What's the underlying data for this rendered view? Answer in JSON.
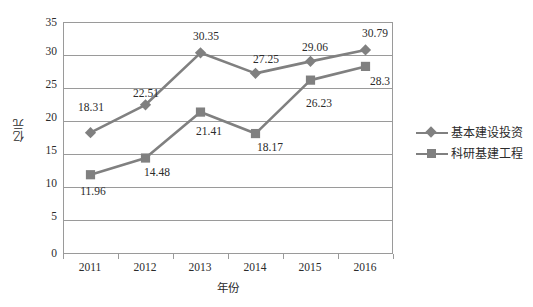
{
  "chart_data": {
    "type": "line",
    "title": "",
    "xlabel": "年份",
    "ylabel": "亿元",
    "categories": [
      "2011",
      "2012",
      "2013",
      "2014",
      "2015",
      "2016"
    ],
    "ylim": [
      0,
      35
    ],
    "yticks": [
      "0",
      "5",
      "10",
      "15",
      "20",
      "25",
      "30",
      "35"
    ],
    "grid": true,
    "legend_position": "right",
    "series": [
      {
        "name": "基本建设投资",
        "marker": "diamond",
        "color": "#808080",
        "values": [
          18.31,
          22.51,
          30.35,
          27.25,
          29.06,
          30.79
        ],
        "labels": [
          "18.31",
          "22.51",
          "30.35",
          "27.25",
          "29.06",
          "30.79"
        ]
      },
      {
        "name": "科研基建工程",
        "marker": "square",
        "color": "#808080",
        "values": [
          11.96,
          14.48,
          21.41,
          18.17,
          26.23,
          28.3
        ],
        "labels": [
          "11.96",
          "14.48",
          "21.41",
          "18.17",
          "26.23",
          "28.3"
        ]
      }
    ]
  },
  "axis": {
    "y_title": "亿元",
    "x_title": "年份",
    "y_ticks": [
      "35",
      "30",
      "25",
      "20",
      "15",
      "10",
      "5",
      "0"
    ],
    "x_ticks": [
      "2011",
      "2012",
      "2013",
      "2014",
      "2015",
      "2016"
    ]
  },
  "legend": {
    "items": [
      {
        "label": "基本建设投资",
        "marker": "diamond-marker"
      },
      {
        "label": "科研基建工程",
        "marker": "square-marker"
      }
    ]
  },
  "labels": {
    "s1": [
      "18.31",
      "22.51",
      "30.35",
      "27.25",
      "29.06",
      "30.79"
    ],
    "s2": [
      "11.96",
      "14.48",
      "21.41",
      "18.17",
      "26.23",
      "28.3"
    ]
  }
}
